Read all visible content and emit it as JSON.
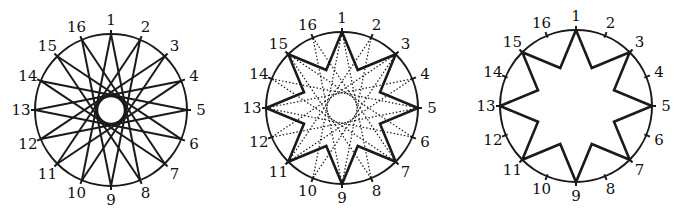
{
  "diagram": {
    "point_count": 16,
    "labels": [
      "1",
      "2",
      "3",
      "4",
      "5",
      "6",
      "7",
      "8",
      "9",
      "10",
      "11",
      "12",
      "13",
      "14",
      "15",
      "16"
    ],
    "stroke_color": "#1a1a1a",
    "figures": [
      {
        "id": "star-16-7",
        "center": [
          111,
          110
        ],
        "radius": 76,
        "step": 7,
        "style": "solid",
        "tick_points": "all",
        "inner_circle_radius": 14
      },
      {
        "id": "star-16-7-with-8-3-highlight",
        "center": [
          342,
          108
        ],
        "radius": 76,
        "step": 7,
        "style": "dotted",
        "highlight": "odd-star-outline",
        "tick_points": "all"
      },
      {
        "id": "star-8-3-outline",
        "center": [
          576,
          106
        ],
        "radius": 76,
        "highlight": "odd-star-outline",
        "tick_points": "all"
      }
    ]
  }
}
